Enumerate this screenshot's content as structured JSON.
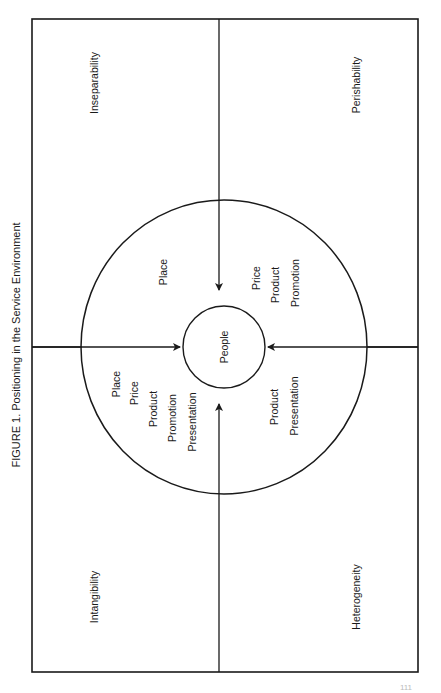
{
  "figure": {
    "caption": "FIGURE 1. Positioning in the Service Environment",
    "page_number": "111"
  },
  "quadrants": {
    "top_left": "Inseparability",
    "top_right": "Perishability",
    "bottom_left": "Intangibility",
    "bottom_right": "Heterogeneity"
  },
  "center": {
    "label": "People"
  },
  "ring_labels": {
    "upper_left": [
      "Place"
    ],
    "upper_right": [
      "Price",
      "Product",
      "Promotion"
    ],
    "lower_left": [
      "Place",
      "Price",
      "Product",
      "Promotion",
      "Presentation"
    ],
    "lower_right": [
      "Product",
      "Presentation"
    ]
  },
  "colors": {
    "line": "#1a1a1a",
    "background": "#ffffff"
  }
}
